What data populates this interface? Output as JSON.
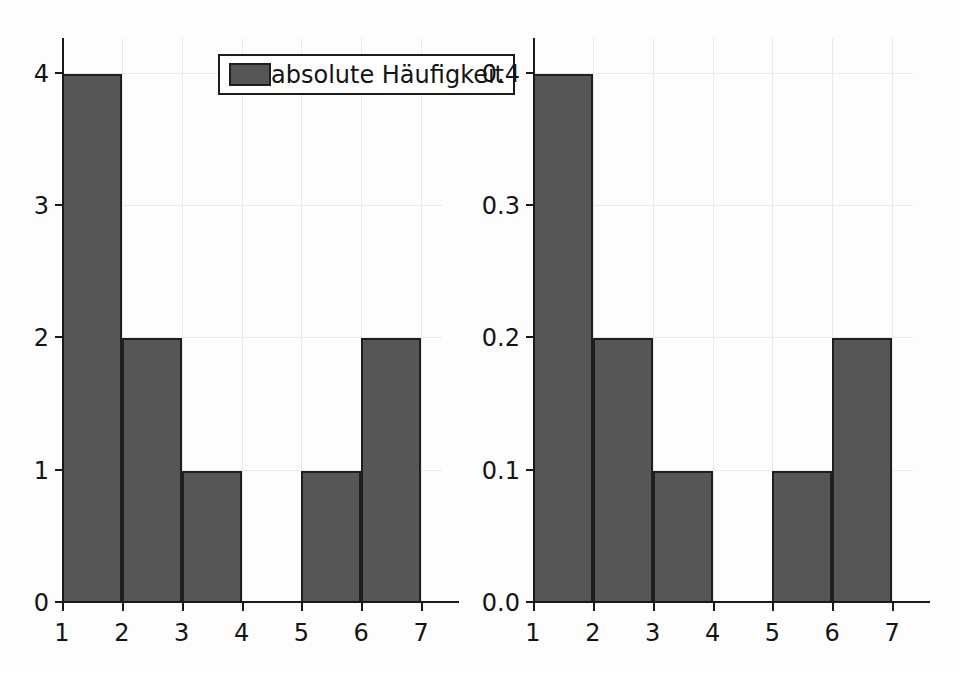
{
  "figure": {
    "background_color": "#fdfdfd",
    "bar_color": "#565656",
    "bar_edge_color": "#1e1e1e",
    "axis_color": "#1a1a1a",
    "grid_color": "#e9e9e9"
  },
  "chart_data": [
    {
      "type": "bar",
      "title": "",
      "subtitle": "",
      "xlabel": "",
      "ylabel": "",
      "legend": [
        "absolute Häufigkeit"
      ],
      "legend_position": "upper right",
      "grid": true,
      "xlim": [
        1,
        7.35
      ],
      "ylim": [
        0,
        4.27
      ],
      "xticks": [
        1,
        2,
        3,
        4,
        5,
        6,
        7
      ],
      "xticklabels": [
        "1",
        "2",
        "3",
        "4",
        "5",
        "6",
        "7"
      ],
      "yticks": [
        0,
        1,
        2,
        3,
        4
      ],
      "yticklabels": [
        "0",
        "1",
        "2",
        "3",
        "4"
      ],
      "bin_edges": [
        1,
        2,
        3,
        4,
        5,
        6,
        7
      ],
      "categories": [
        "1-2",
        "2-3",
        "3-4",
        "4-5",
        "5-6",
        "6-7"
      ],
      "values": [
        4,
        2,
        1,
        0,
        1,
        2
      ],
      "annotations": []
    },
    {
      "type": "bar",
      "title": "",
      "subtitle": "",
      "xlabel": "",
      "ylabel": "",
      "legend": [
        "Normalisiert"
      ],
      "legend_position": "upper right",
      "grid": true,
      "xlim": [
        1,
        7.35
      ],
      "ylim": [
        0,
        0.427
      ],
      "xticks": [
        1,
        2,
        3,
        4,
        5,
        6,
        7
      ],
      "xticklabels": [
        "1",
        "2",
        "3",
        "4",
        "5",
        "6",
        "7"
      ],
      "yticks": [
        0.0,
        0.1,
        0.2,
        0.3,
        0.4
      ],
      "yticklabels": [
        "0.0",
        "0.1",
        "0.2",
        "0.3",
        "0.4"
      ],
      "bin_edges": [
        1,
        2,
        3,
        4,
        5,
        6,
        7
      ],
      "categories": [
        "1-2",
        "2-3",
        "3-4",
        "4-5",
        "5-6",
        "6-7"
      ],
      "values": [
        0.4,
        0.2,
        0.1,
        0.0,
        0.1,
        0.2
      ],
      "annotations": []
    }
  ],
  "panels": [
    {
      "id": "left",
      "legend_label": "absolute Häufigkeit",
      "yticklabels": [
        "0",
        "1",
        "2",
        "3",
        "4"
      ],
      "xticklabels": [
        "1",
        "2",
        "3",
        "4",
        "5",
        "6",
        "7"
      ]
    },
    {
      "id": "right",
      "legend_label": "Normalisiert",
      "yticklabels": [
        "0.0",
        "0.1",
        "0.2",
        "0.3",
        "0.4"
      ],
      "xticklabels": [
        "1",
        "2",
        "3",
        "4",
        "5",
        "6",
        "7"
      ]
    }
  ]
}
